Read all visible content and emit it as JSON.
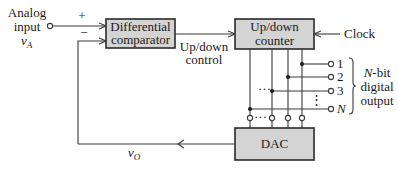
{
  "diagram": {
    "input": {
      "label_line1": "Analog",
      "label_line2": "input",
      "symbol": "v",
      "symbol_sub": "A",
      "plus_sign": "+",
      "minus_sign": "−"
    },
    "blocks": {
      "comparator": {
        "line1": "Differential",
        "line2": "comparator"
      },
      "counter": {
        "line1": "Up/down",
        "line2": "counter"
      },
      "dac": {
        "label": "DAC"
      }
    },
    "signals": {
      "updown_line1": "Up/down",
      "updown_line2": "control",
      "clock": "Clock",
      "feedback_symbol": "v",
      "feedback_sub": "O"
    },
    "outputs": {
      "bits": [
        "1",
        "2",
        "3",
        "N"
      ],
      "ellipsis_h": "···",
      "ellipsis_v": "⋮",
      "group_line1": "N",
      "group_line1_suffix": "-bit",
      "group_line2": "digital",
      "group_line3": "output"
    },
    "colors": {
      "block_fill": "#d4d4d4",
      "stroke": "#2a2a2a",
      "background": "#ffffff"
    }
  }
}
